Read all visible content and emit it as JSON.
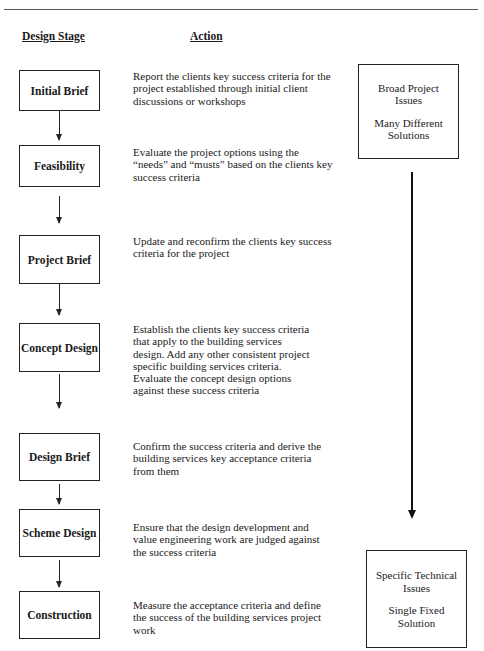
{
  "headers": {
    "design_stage": "Design Stage",
    "action": "Action"
  },
  "stages": [
    {
      "label": "Initial Brief",
      "action": "Report the clients key success criteria for the project established through initial client discussions or workshops"
    },
    {
      "label": "Feasibility",
      "action": "Evaluate the project options using the “needs” and “musts” based on the clients key success criteria"
    },
    {
      "label": "Project Brief",
      "action": "Update and reconfirm the clients key success criteria for the project"
    },
    {
      "label": "Concept Design",
      "action": "Establish the clients key success criteria that apply to the building services design.  Add any other consistent project specific building services criteria.  Evaluate the concept design options against these success criteria"
    },
    {
      "label": "Design Brief",
      "action": "Confirm the success criteria and derive the building services key acceptance criteria from them"
    },
    {
      "label": "Scheme Design",
      "action": "Ensure that the design development and value engineering work are judged against the  success criteria"
    },
    {
      "label": "Construction",
      "action": "Measure the acceptance criteria and define the success of the building services project work"
    }
  ],
  "scope": {
    "top": {
      "line1": "Broad Project Issues",
      "line2": "Many Different Solutions"
    },
    "bottom": {
      "line1": "Specific Technical Issues",
      "line2": "Single Fixed Solution"
    }
  }
}
